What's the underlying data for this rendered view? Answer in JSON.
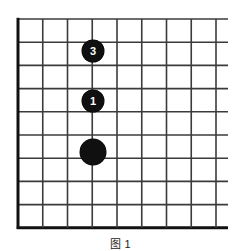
{
  "figure": {
    "caption": "图 1",
    "caption_visible_note": "cropped"
  },
  "board": {
    "type": "go-board",
    "background_color": "#ffffff",
    "line_color": "#3b3b3b",
    "border_color": "#111111",
    "stone_color": "#101010",
    "stone_label_color": "#ffffff",
    "columns": 9,
    "rows": 10,
    "origin_x": 18,
    "origin_y": 19,
    "col_spacing": 24.75,
    "row_spacing": 23.2,
    "line_width": 1.6,
    "border_width": 3,
    "right_overhang": 12,
    "edges": {
      "left": "thick",
      "top": "thin",
      "bottom": "thick",
      "right": "open"
    }
  },
  "stones": [
    {
      "id": "stone-3",
      "label": "3",
      "color": "black",
      "col": 3,
      "row": 1,
      "cx": 93,
      "cy": 51,
      "radius": 11
    },
    {
      "id": "stone-1",
      "label": "1",
      "color": "black",
      "col": 3,
      "row": 3,
      "cx": 93,
      "cy": 101,
      "radius": 11
    },
    {
      "id": "stone-unnumbered",
      "label": "",
      "color": "black",
      "col": 3,
      "row": 5,
      "cx": 93,
      "cy": 152,
      "radius": 13
    }
  ]
}
